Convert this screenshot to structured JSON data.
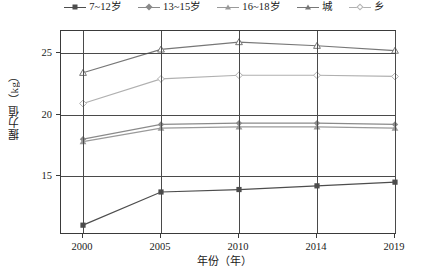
{
  "chart_data": {
    "type": "line",
    "title": "",
    "xlabel": "年份（年）",
    "ylabel": "握力值（kg）",
    "categories": [
      "2000",
      "2005",
      "2010",
      "2014",
      "2019"
    ],
    "x_tick_labels": [
      "2000",
      "2005",
      "2010",
      "2014",
      "2019"
    ],
    "y_tick_labels": [
      "15",
      "20",
      "25"
    ],
    "y_ticks": [
      15,
      20,
      25
    ],
    "ylim": [
      10.2,
      26.8
    ],
    "grid": "both",
    "legend_position": "top",
    "series": [
      {
        "name": "7~12岁",
        "marker": "square-filled",
        "color": "#4d4d4d",
        "values": [
          11.0,
          13.7,
          13.9,
          14.2,
          14.5
        ]
      },
      {
        "name": "13~15岁",
        "marker": "diamond-filled",
        "color": "#8a8a8a",
        "values": [
          18.0,
          19.2,
          19.3,
          19.3,
          19.2
        ]
      },
      {
        "name": "16~18岁",
        "marker": "triangle-filled",
        "color": "#9a9a9a",
        "values": [
          17.8,
          18.9,
          19.0,
          19.0,
          18.9
        ]
      },
      {
        "name": "城",
        "marker": "triangle-open",
        "color": "#777777",
        "values": [
          23.4,
          25.3,
          25.9,
          25.6,
          25.2
        ]
      },
      {
        "name": "乡",
        "marker": "diamond-open",
        "color": "#b0b0b0",
        "values": [
          20.9,
          22.9,
          23.2,
          23.2,
          23.1
        ]
      }
    ]
  },
  "legend": {
    "items": [
      {
        "label": "7~12岁"
      },
      {
        "label": "13~15岁"
      },
      {
        "label": "16~18岁"
      },
      {
        "label": "城"
      },
      {
        "label": "乡"
      }
    ]
  },
  "axes": {
    "x_title": "年份（年）",
    "y_title": "握力值（kg）"
  }
}
